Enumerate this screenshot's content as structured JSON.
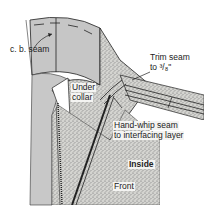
{
  "diagram": {
    "labels": {
      "cb_seam": "c. b. seam",
      "under_collar": "Under collar",
      "under_collar_line1": "Under",
      "under_collar_line2": "collar",
      "trim_seam_line1": "Trim seam",
      "trim_seam_line2": "to ³/₈\"",
      "hand_whip_line1": "Hand-whip seam",
      "hand_whip_line2": "to interfacing layer",
      "inside": "Inside",
      "front": "Front"
    },
    "colors": {
      "garment_fill": "#c8c8c8",
      "stipple_fill": "#a8a8a8",
      "line": "#222222",
      "background": "#ffffff"
    }
  }
}
